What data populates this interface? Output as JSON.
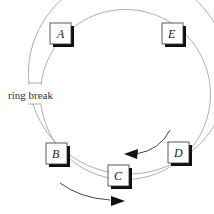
{
  "diagram": {
    "title": "",
    "break_label": "ring break",
    "nodes": [
      {
        "id": "A",
        "label": "A"
      },
      {
        "id": "E",
        "label": "E"
      },
      {
        "id": "B",
        "label": "B"
      },
      {
        "id": "C",
        "label": "C"
      },
      {
        "id": "D",
        "label": "D"
      }
    ],
    "arrows": [
      {
        "name": "inner-flow-arrow",
        "direction": "counterclockwise"
      },
      {
        "name": "outer-flow-arrow",
        "direction": "clockwise"
      }
    ],
    "colors": {
      "ring": "#999999",
      "box_border": "#333333",
      "shadow": "#111111",
      "arrow": "#111111"
    }
  }
}
